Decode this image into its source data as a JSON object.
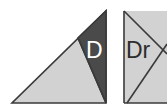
{
  "figure": {
    "background_color": "#ffffff",
    "panels": [
      {
        "id": "left",
        "label_text": "D",
        "label_color": "#ffffff",
        "shapes": [
          {
            "name": "outer-triangle",
            "fill": "#d2d2d2",
            "stroke": "#3a3a3a",
            "points": "12,103 106,103 106,11"
          },
          {
            "name": "shaded-subregion",
            "fill": "#4a4a4a",
            "stroke": "#3a3a3a",
            "points": "78,38 106,103 106,11"
          }
        ],
        "divider": {
          "name": "subdivision-line",
          "from": "78,38",
          "to": "106,103",
          "stroke": "#3a3a3a"
        }
      },
      {
        "id": "right",
        "label_text": "Dr",
        "label_color": "#2d2d2d",
        "cropped_at_right_edge": true,
        "shapes": [
          {
            "name": "outer-triangle",
            "fill": "#d2d2d2",
            "stroke": "#3a3a3a",
            "points": "7,103 50,103 50,11 7,11"
          }
        ],
        "divider": {
          "name": "subdivision-line",
          "from": "10,103",
          "to": "50,44",
          "stroke": "#3a3a3a"
        }
      }
    ],
    "palette": {
      "light_gray": "#d2d2d2",
      "dark_gray": "#4a4a4a",
      "outline": "#3a3a3a",
      "white": "#ffffff",
      "text_dark": "#2d2d2d"
    }
  }
}
